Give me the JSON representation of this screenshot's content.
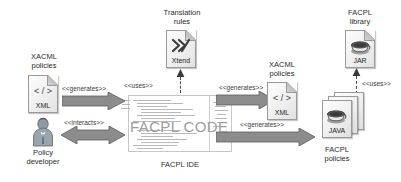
{
  "diagram": {
    "center": {
      "code_overlay_text": "FACPL CODE",
      "caption": "FACPL IDE"
    },
    "nodes": {
      "xacml_policies_in": {
        "label": "XACML\npolicies",
        "badge": "XML",
        "glyph": "</>",
        "icon_name": "xml-file-icon"
      },
      "translation_rules": {
        "label": "Translation\nrules",
        "badge": "Xtend",
        "glyph": "X",
        "icon_name": "xtend-file-icon"
      },
      "policy_developer": {
        "label": "Policy\ndeveloper",
        "icon_name": "person-icon"
      },
      "xacml_policies_out": {
        "label": "XACML\npolicies",
        "badge": "XML",
        "glyph": "</>",
        "icon_name": "xml-file-icon"
      },
      "facpl_library": {
        "label": "FACPL\nlibrary",
        "badge": "JAR",
        "icon_name": "jar-file-icon"
      },
      "java_facpl_policies": {
        "label": "FACPL\npolicies",
        "badge": "JAVA",
        "icon_name": "java-files-stack-icon"
      }
    },
    "edges": {
      "generates_left": "<<generates>>",
      "interacts": "<<interacts>>",
      "uses_xtend": "<<uses>>",
      "generates_xml": "<<generates>>",
      "generates_java": "<<generates>>",
      "uses_jar": "<<uses>>"
    }
  },
  "colors": {
    "arrow_fill": "#8c8c8c",
    "arrow_stroke": "#5d5d5d",
    "icon_fill": "#f0f0f0",
    "icon_stroke": "#9a9a9a",
    "text": "#2b2b2b",
    "code_overlay": "#9d9d9d",
    "background": "#ffffff"
  }
}
